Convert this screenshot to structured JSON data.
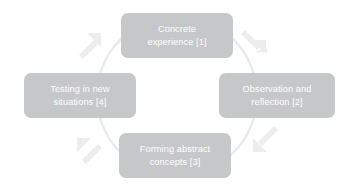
{
  "diagram": {
    "type": "cyclical-process-diagram",
    "direction": "clockwise",
    "colors": {
      "background": "#ffffff",
      "node_fill": "#c6c7c8",
      "node_text": "#ffffff",
      "circle_stroke": "#e9e9e9",
      "arrow_fill": "#ededed"
    },
    "circle": {
      "center_x": 177,
      "center_y": 96,
      "radius": 80
    },
    "nodes": [
      {
        "id": "node-1",
        "position": "top",
        "label": "Concrete\nexperience [1]",
        "step": 1
      },
      {
        "id": "node-2",
        "position": "right",
        "label": "Observation and\nreflection [2]",
        "step": 2
      },
      {
        "id": "node-3",
        "position": "bottom",
        "label": "Forming abstract\nconcepts [3]",
        "step": 3
      },
      {
        "id": "node-4",
        "position": "left",
        "label": "Testing in new\nsituations [4]",
        "step": 4
      }
    ],
    "arrows": [
      {
        "id": "arrow-top-right",
        "name": "arrow-down-right-icon",
        "from_step": 1,
        "to_step": 2,
        "direction": "down-right"
      },
      {
        "id": "arrow-bottom-right",
        "name": "arrow-down-left-icon",
        "from_step": 2,
        "to_step": 3,
        "direction": "down-left"
      },
      {
        "id": "arrow-bottom-left",
        "name": "arrow-up-left-icon",
        "from_step": 3,
        "to_step": 4,
        "direction": "up-left"
      },
      {
        "id": "arrow-top-left",
        "name": "arrow-up-right-icon",
        "from_step": 4,
        "to_step": 1,
        "direction": "up-right"
      }
    ]
  }
}
